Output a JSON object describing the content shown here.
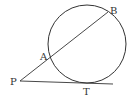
{
  "diagram": {
    "type": "geometry",
    "stroke_color": "#333333",
    "circle": {
      "cx": 87,
      "cy": 44,
      "r": 39
    },
    "points": {
      "P": {
        "label": "P",
        "x": 20,
        "y": 81
      },
      "A": {
        "label": "A",
        "x": 50,
        "y": 57
      },
      "B": {
        "label": "B",
        "x": 108,
        "y": 12
      },
      "T": {
        "label": "T",
        "x": 87,
        "y": 83
      }
    },
    "lines": [
      {
        "name": "secant-PB",
        "from": "P",
        "to": "B"
      },
      {
        "name": "tangent-PT",
        "from": "P",
        "to_x": 113,
        "to_y": 84
      }
    ]
  }
}
